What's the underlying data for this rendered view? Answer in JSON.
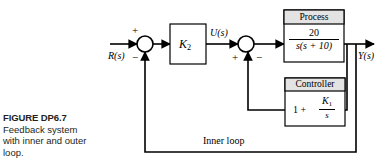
{
  "figure": {
    "caption_title": "FIGURE DP6.7",
    "caption_body": "Feedback system with inner and outer loop."
  },
  "diagram": {
    "type": "control-block-diagram",
    "input_label": "R(s)",
    "output_label": "Y(s)",
    "intermediate_label": "U(s)",
    "inner_loop_label": "Inner loop",
    "gain_block": {
      "label": "K",
      "subscript": "2"
    },
    "process_block": {
      "title": "Process",
      "numerator": "20",
      "denominator": "s(s + 10)"
    },
    "controller_block": {
      "title": "Controller",
      "lead_term": "1 +",
      "numerator": "K",
      "numerator_subscript": "1",
      "denominator": "s"
    },
    "summing_junction_1": {
      "name": "outer-summing-junction",
      "top_sign": "+",
      "bottom_sign": "−"
    },
    "summing_junction_2": {
      "name": "inner-summing-junction",
      "left_sign": "+",
      "right_sign": "−"
    },
    "colors": {
      "line": "#000000",
      "block_header_fill": "#e3e3e3",
      "block_fill": "#ffffff",
      "text": "#000000",
      "caption_text": "#231f20"
    }
  }
}
